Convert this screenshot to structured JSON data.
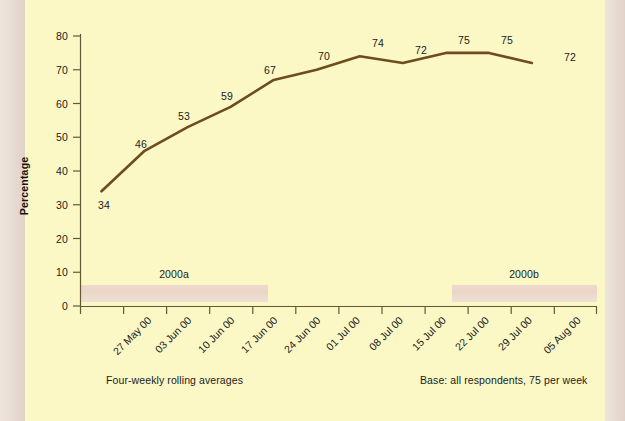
{
  "chart_data": {
    "type": "line",
    "title": "",
    "subtitle": "",
    "xlabel": "",
    "ylabel": "Percentage",
    "categories": [
      "27 May 00",
      "03 Jun 00",
      "10 Jun 00",
      "17 Jun 00",
      "24 Jun 00",
      "01 Jul 00",
      "08 Jul 00",
      "15 Jul 00",
      "22 Jul 00",
      "29 Jul 00",
      "05 Aug 00"
    ],
    "values": [
      34,
      46,
      53,
      59,
      67,
      70,
      74,
      72,
      75,
      75,
      72
    ],
    "series": [
      {
        "name": "Percentage",
        "values": [
          34,
          46,
          53,
          59,
          67,
          70,
          74,
          72,
          75,
          75,
          72
        ]
      }
    ],
    "ylim": [
      0,
      80
    ],
    "yticks": [
      0,
      10,
      20,
      30,
      40,
      50,
      60,
      70,
      80
    ],
    "grid": false,
    "legend": "none",
    "line_color": "#6e4c1e",
    "plot_background": "#fbf8c6",
    "page_background": "#e6d9d0",
    "data_labels": true,
    "annotations": [
      {
        "label": "2000a",
        "type": "period-band",
        "start_category": "27 May 00",
        "end_category": "24 Jun 00",
        "color": "#eed9cc"
      },
      {
        "label": "2000b",
        "type": "period-band",
        "start_category": "22 Jul 00",
        "end_category": "05 Aug 00",
        "color": "#eed9cc"
      }
    ],
    "footnotes": {
      "left": "Four-weekly rolling averages",
      "right": "Base: all respondents, 75 per week"
    }
  },
  "axes": {
    "y_title": "Percentage",
    "y_tick_labels": [
      "80",
      "70",
      "60",
      "50",
      "40",
      "30",
      "20",
      "10",
      "0"
    ],
    "x_tick_labels": [
      "27 May 00",
      "03 Jun 00",
      "10 Jun 00",
      "17 Jun 00",
      "24 Jun 00",
      "01 Jul 00",
      "08 Jul 00",
      "15 Jul 00",
      "22 Jul 00",
      "29 Jul 00",
      "05 Aug 00"
    ]
  },
  "data_labels": [
    "34",
    "46",
    "53",
    "59",
    "67",
    "70",
    "74",
    "72",
    "75",
    "75",
    "72"
  ],
  "bands": [
    {
      "label": "2000a"
    },
    {
      "label": "2000b"
    }
  ],
  "footnotes": {
    "left": "Four-weekly rolling averages",
    "right": "Base: all respondents, 75 per week"
  }
}
